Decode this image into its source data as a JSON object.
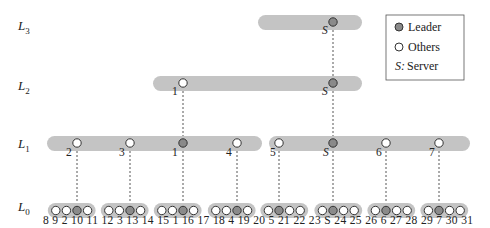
{
  "levels": [
    {
      "label": "L",
      "sub": "3"
    },
    {
      "label": "L",
      "sub": "2"
    },
    {
      "label": "L",
      "sub": "1"
    },
    {
      "label": "L",
      "sub": "0"
    }
  ],
  "legend": {
    "leader": "Leader",
    "others": "Others",
    "server_key": "S:",
    "server": "Server"
  },
  "l3": {
    "nodes": [
      {
        "label": "S",
        "type": "leader"
      }
    ]
  },
  "l2": {
    "nodes": [
      {
        "label": "1",
        "type": "other"
      },
      {
        "label": "S",
        "type": "leader"
      }
    ]
  },
  "l1": {
    "left": [
      {
        "label": "2",
        "type": "other"
      },
      {
        "label": "3",
        "type": "other"
      },
      {
        "label": "1",
        "type": "leader"
      },
      {
        "label": "4",
        "type": "other"
      }
    ],
    "right": [
      {
        "label": "5",
        "type": "other"
      },
      {
        "label": "S",
        "type": "leader"
      },
      {
        "label": "6",
        "type": "other"
      },
      {
        "label": "7",
        "type": "other"
      }
    ]
  },
  "l0": {
    "groups": [
      [
        "8",
        "9",
        "2",
        "10"
      ],
      [
        "11",
        "12",
        "3",
        "13"
      ],
      [
        "14",
        "15",
        "1",
        "16"
      ],
      [
        "17",
        "18",
        "4",
        "19"
      ],
      [
        "20",
        "5",
        "21",
        "22"
      ],
      [
        "23",
        "S",
        "24",
        "25"
      ],
      [
        "26",
        "6",
        "27",
        "28"
      ],
      [
        "29",
        "7",
        "30",
        "31"
      ]
    ],
    "leader_index": [
      2,
      2,
      2,
      2,
      1,
      1,
      1,
      1
    ]
  }
}
